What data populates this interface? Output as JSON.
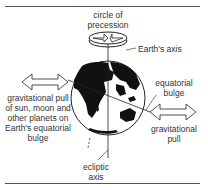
{
  "diagram": {
    "labels": {
      "circle_of_precession_1": "circle of",
      "circle_of_precession_2": "precession",
      "earths_axis": "Earth's axis",
      "equatorial_bulge_1": "equatorial",
      "equatorial_bulge_2": "bulge",
      "grav_pull_left_1": "gravitational pull",
      "grav_pull_left_2": "of sun, moon and",
      "grav_pull_left_3": "other planets on",
      "grav_pull_left_4": "Earth's equatorial",
      "grav_pull_left_5": "bulge",
      "grav_pull_right_1": "gravitational",
      "grav_pull_right_2": "pull",
      "ecliptic_axis_1": "ecliptic",
      "ecliptic_axis_2": "axis"
    },
    "colors": {
      "line": "#333333",
      "land": "#111111",
      "background": "#ffffff"
    }
  }
}
